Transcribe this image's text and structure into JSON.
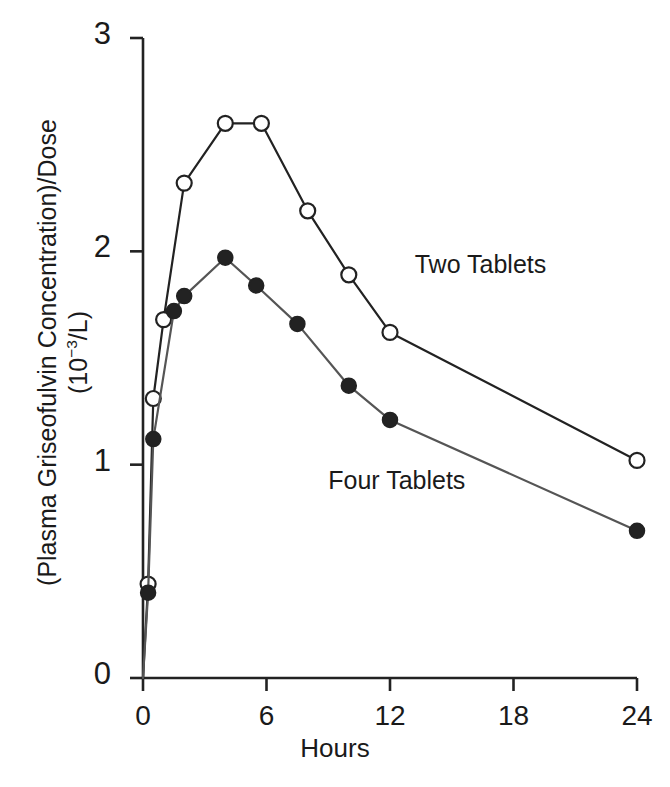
{
  "chart_data": {
    "type": "line",
    "title": "",
    "xlabel": "Hours",
    "ylabel_line1": "(Plasma Griseofulvin Concentration)/Dose",
    "ylabel_line2_prefix": "(10",
    "ylabel_line2_sup": "−3",
    "ylabel_line2_suffix": "/L)",
    "xlim": [
      0,
      24
    ],
    "ylim": [
      0,
      3
    ],
    "xticks": [
      0,
      6,
      12,
      18,
      24
    ],
    "xtick_labels": [
      "0",
      "6",
      "12",
      "18",
      "24"
    ],
    "yticks": [
      0,
      1,
      2,
      3
    ],
    "ytick_labels": [
      "0",
      "1",
      "2",
      "3"
    ],
    "grid": false,
    "legend_position": "inline-annotations",
    "series": [
      {
        "name": "Two Tablets",
        "marker": "open-circle",
        "marker_fill": "#ffffff",
        "color": "#222222",
        "x": [
          0,
          0.25,
          0.5,
          1.0,
          2.0,
          4.0,
          5.75,
          8.0,
          10.0,
          12.0,
          24.0
        ],
        "y": [
          0.0,
          0.44,
          1.31,
          1.68,
          2.32,
          2.6,
          2.6,
          2.19,
          1.89,
          1.62,
          1.02
        ]
      },
      {
        "name": "Four Tablets",
        "marker": "filled-circle",
        "marker_fill": "#222222",
        "color": "#555555",
        "x": [
          0,
          0.25,
          0.5,
          1.5,
          2.0,
          4.0,
          5.5,
          7.5,
          10.0,
          12.0,
          24.0
        ],
        "y": [
          0.0,
          0.4,
          1.12,
          1.72,
          1.79,
          1.97,
          1.84,
          1.66,
          1.37,
          1.21,
          0.69
        ]
      }
    ],
    "annotations": [
      {
        "text": "Two Tablets",
        "x": 13.2,
        "y": 1.93
      },
      {
        "text": "Four Tablets",
        "x": 9.0,
        "y": 0.92
      }
    ]
  }
}
